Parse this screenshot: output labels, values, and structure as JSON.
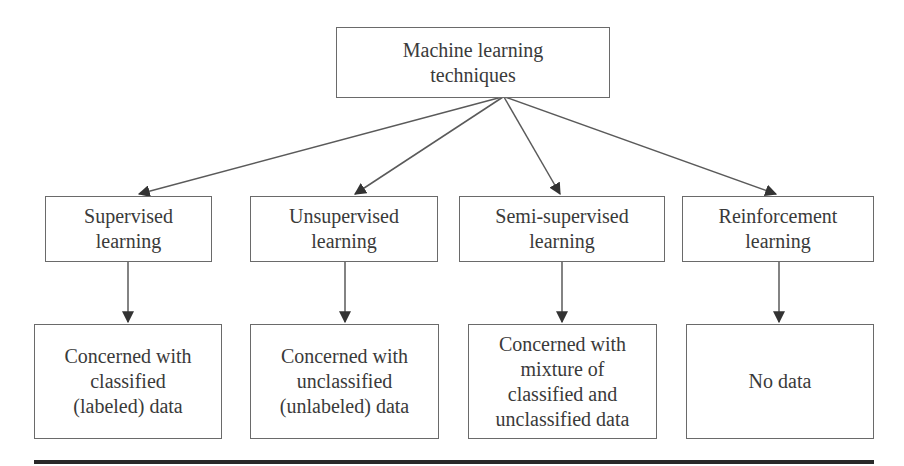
{
  "diagram": {
    "root": {
      "label": "Machine learning\ntechniques"
    },
    "categories": [
      {
        "label": "Supervised\nlearning",
        "description": "Concerned with\nclassified\n(labeled) data"
      },
      {
        "label": "Unsupervised\nlearning",
        "description": "Concerned with\nunclassified\n(unlabeled) data"
      },
      {
        "label": "Semi-supervised\nlearning",
        "description": "Concerned with\nmixture of\nclassified and\nunclassified data"
      },
      {
        "label": "Reinforcement\nlearning",
        "description": "No data"
      }
    ],
    "colors": {
      "stroke": "#6a6a6a",
      "text": "#3a3a3a",
      "rule": "#2a2a2a"
    }
  }
}
